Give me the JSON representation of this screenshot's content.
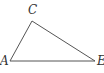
{
  "diagram": {
    "type": "triangle",
    "vertices": [
      {
        "label": "A",
        "x": 10,
        "y": 61
      },
      {
        "label": "C",
        "x": 32,
        "y": 21
      },
      {
        "label": "E",
        "x": 95,
        "y": 61
      }
    ],
    "edges": [
      [
        "A",
        "C"
      ],
      [
        "C",
        "E"
      ],
      [
        "A",
        "E"
      ]
    ],
    "stroke_color": "#555555"
  }
}
